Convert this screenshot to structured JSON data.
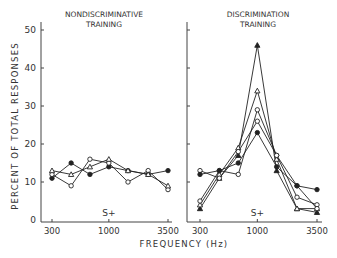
{
  "chart_data": [
    {
      "type": "line",
      "title": "NONDISCRIMINATIVE TRAINING",
      "title_lines": [
        "NONDISCRIMINATIVE",
        "TRAINING"
      ],
      "xlabel": "FREQUENCY (Hz)",
      "ylabel": "PERCENT OF TOTAL RESPONSES",
      "ylim": [
        0,
        50
      ],
      "yticks": [
        0,
        10,
        20,
        30,
        40,
        50
      ],
      "x": [
        300,
        450,
        670,
        1000,
        1500,
        2300,
        3500
      ],
      "xtick_labels": [
        "300",
        "1000",
        "3500"
      ],
      "xtick_values": [
        300,
        1000,
        3500
      ],
      "annotation": "S+",
      "annotation_x": 1000,
      "grid": false,
      "series": [
        {
          "name": "filled-circle",
          "marker": "filled-circle",
          "values": [
            11,
            15,
            12,
            14,
            13,
            12,
            13
          ]
        },
        {
          "name": "open-circle",
          "marker": "open-circle",
          "values": [
            12,
            9,
            16,
            15,
            10,
            13,
            8
          ]
        },
        {
          "name": "open-triangle",
          "marker": "open-triangle",
          "values": [
            13,
            12,
            14,
            16,
            13,
            12,
            9
          ]
        }
      ]
    },
    {
      "type": "line",
      "title": "DISCRIMINATION TRAINING",
      "title_lines": [
        "DISCRIMINATION",
        "TRAINING"
      ],
      "xlabel": "FREQUENCY (Hz)",
      "ylabel": "PERCENT OF TOTAL RESPONSES",
      "ylim": [
        0,
        50
      ],
      "yticks": [
        0,
        10,
        20,
        30,
        40,
        50
      ],
      "x": [
        300,
        450,
        670,
        1000,
        1500,
        2300,
        3500
      ],
      "xtick_labels": [
        "300",
        "1000",
        "3500"
      ],
      "xtick_values": [
        300,
        1000,
        3500
      ],
      "annotation": "S+",
      "annotation_x": 1000,
      "grid": false,
      "series": [
        {
          "name": "filled-triangle",
          "marker": "filled-triangle",
          "values": [
            3,
            11,
            17,
            46,
            13,
            3,
            2
          ]
        },
        {
          "name": "open-triangle",
          "marker": "open-triangle",
          "values": [
            4,
            12,
            19,
            34,
            16,
            3,
            3
          ]
        },
        {
          "name": "open-circle-a",
          "marker": "open-circle",
          "values": [
            5,
            13,
            12,
            29,
            17,
            6,
            4
          ]
        },
        {
          "name": "open-circle-b",
          "marker": "open-circle",
          "values": [
            13,
            11,
            18,
            26,
            17,
            9,
            3
          ]
        },
        {
          "name": "filled-circle",
          "marker": "filled-circle",
          "values": [
            12,
            13,
            15,
            23,
            14,
            9,
            8
          ]
        }
      ]
    }
  ],
  "shared": {
    "ylabel": "PERCENT OF TOTAL RESPONSES",
    "xlabel": "FREQUENCY (Hz)"
  }
}
